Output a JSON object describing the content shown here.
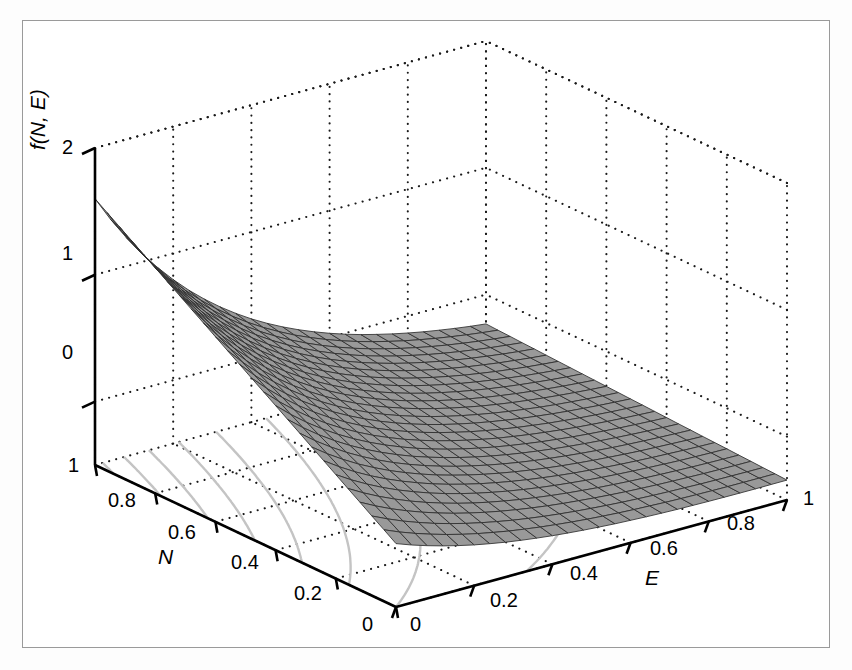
{
  "figure": {
    "background": "#ffffff",
    "frame_color": "#9a9a9a",
    "width": 852,
    "height": 670
  },
  "style": {
    "surface_face_color": "#999999",
    "surface_mesh_color": "#2e2e2e",
    "contour_color": "#c4c4c4",
    "grid_dot_color": "#1a1a1a",
    "axis_line_color": "#000000",
    "text_color": "#000000"
  },
  "axes": {
    "z": {
      "label": "f(N, E)",
      "ticks": [
        "0",
        "1",
        "2"
      ],
      "values": [
        0,
        1,
        2
      ],
      "range": [
        -0.5,
        2.0
      ]
    },
    "x": {
      "label": "E",
      "ticks": [
        "0",
        "0.2",
        "0.4",
        "0.6",
        "0.8",
        "1"
      ],
      "values": [
        0,
        0.2,
        0.4,
        0.6,
        0.8,
        1
      ],
      "range": [
        0,
        1
      ]
    },
    "y": {
      "label": "N",
      "ticks": [
        "0",
        "0.2",
        "0.4",
        "0.6",
        "0.8",
        "1"
      ],
      "values": [
        0,
        0.2,
        0.4,
        0.6,
        0.8,
        1
      ],
      "range": [
        0,
        1
      ]
    }
  },
  "chart_data": {
    "type": "surface",
    "title": "",
    "xlabel": "E",
    "ylabel": "N",
    "zlabel": "f(N, E)",
    "xlim": [
      0,
      1
    ],
    "ylim": [
      0,
      1
    ],
    "zlim": [
      -0.5,
      2
    ],
    "grid": true,
    "legend": null,
    "mesh_n": 25,
    "projection": "3d-mesh-with-floor-contours",
    "view": {
      "azimuth": -37.5,
      "elevation": 30
    },
    "x": [
      0,
      0.0417,
      0.0833,
      0.125,
      0.1667,
      0.2083,
      0.25,
      0.2917,
      0.3333,
      0.375,
      0.4167,
      0.4583,
      0.5,
      0.5417,
      0.5833,
      0.625,
      0.6667,
      0.7083,
      0.75,
      0.7917,
      0.8333,
      0.875,
      0.9167,
      0.9583,
      1
    ],
    "y": [
      0,
      0.0417,
      0.0833,
      0.125,
      0.1667,
      0.2083,
      0.25,
      0.2917,
      0.3333,
      0.375,
      0.4167,
      0.4583,
      0.5,
      0.5417,
      0.5833,
      0.625,
      0.6667,
      0.7083,
      0.75,
      0.7917,
      0.8333,
      0.875,
      0.9167,
      0.9583,
      1
    ],
    "z_corners": {
      "N1_E0": 2.0,
      "N1_E1": -0.35,
      "N0_E0": -0.5,
      "N0_E1": -0.38
    },
    "contour_levels": [
      -0.25,
      0,
      0.25,
      0.5,
      0.75,
      1.0,
      1.25,
      1.5,
      1.75
    ],
    "floor_contour_count": 9
  },
  "ticklabels": {
    "z": [
      {
        "text": "2",
        "x": 62,
        "y": 136
      },
      {
        "text": "1",
        "x": 62,
        "y": 242
      },
      {
        "text": "0",
        "x": 62,
        "y": 341
      }
    ],
    "y_axis_N": [
      {
        "text": "1",
        "x": 68,
        "y": 454
      },
      {
        "text": "0.8",
        "x": 108,
        "y": 489
      },
      {
        "text": "0.6",
        "x": 168,
        "y": 521
      },
      {
        "text": "0.4",
        "x": 231,
        "y": 551
      },
      {
        "text": "0.2",
        "x": 294,
        "y": 582
      },
      {
        "text": "0",
        "x": 362,
        "y": 613
      }
    ],
    "x_axis_E": [
      {
        "text": "0",
        "x": 410,
        "y": 613
      },
      {
        "text": "0.2",
        "x": 490,
        "y": 589
      },
      {
        "text": "0.4",
        "x": 570,
        "y": 562
      },
      {
        "text": "0.6",
        "x": 650,
        "y": 537
      },
      {
        "text": "0.8",
        "x": 727,
        "y": 512
      },
      {
        "text": "1",
        "x": 803,
        "y": 487
      }
    ]
  },
  "axis_label_positions": {
    "z": {
      "x": 32,
      "y": 150,
      "rotation": -90
    },
    "y": {
      "x": 158,
      "y": 555
    },
    "x": {
      "x": 645,
      "y": 576
    }
  }
}
